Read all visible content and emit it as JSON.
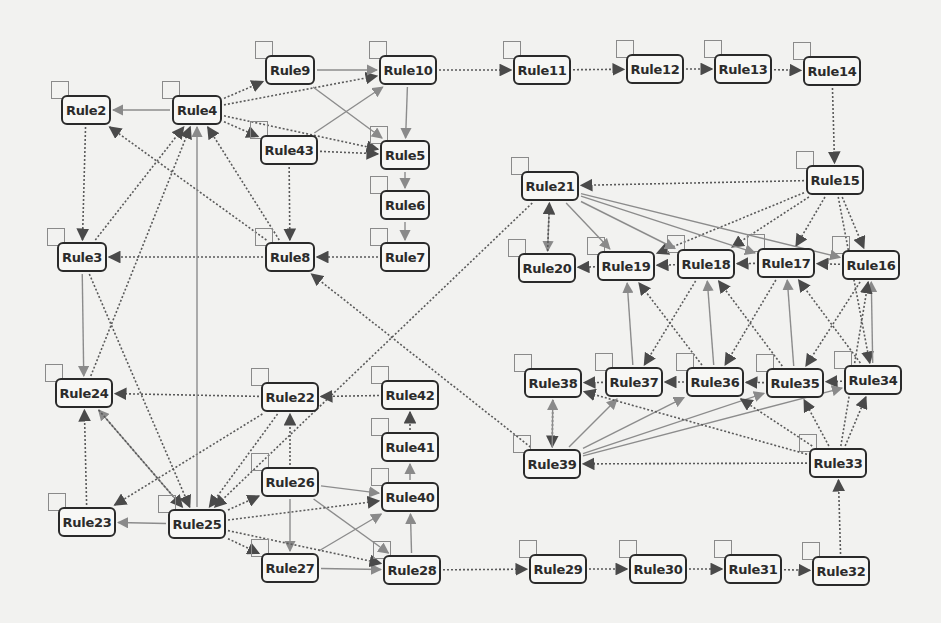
{
  "diagram": {
    "type": "directed-graph",
    "colors": {
      "background": "#f2f2f0",
      "node_border": "#2a2a2a",
      "edge_solid": "#8c8c8c",
      "edge_dashed": "#5a5a5a"
    },
    "nodes": [
      {
        "id": "Rule2",
        "label": "Rule2",
        "x": 86,
        "y": 110,
        "w": 50
      },
      {
        "id": "Rule4",
        "label": "Rule4",
        "x": 197,
        "y": 110,
        "w": 50
      },
      {
        "id": "Rule9",
        "label": "Rule9",
        "x": 290,
        "y": 70,
        "w": 50
      },
      {
        "id": "Rule10",
        "label": "Rule10",
        "x": 408,
        "y": 70,
        "w": 58
      },
      {
        "id": "Rule43",
        "label": "Rule43",
        "x": 289,
        "y": 150,
        "w": 58
      },
      {
        "id": "Rule5",
        "label": "Rule5",
        "x": 405,
        "y": 155,
        "w": 50
      },
      {
        "id": "Rule6",
        "label": "Rule6",
        "x": 405,
        "y": 205,
        "w": 50
      },
      {
        "id": "Rule7",
        "label": "Rule7",
        "x": 405,
        "y": 257,
        "w": 50
      },
      {
        "id": "Rule3",
        "label": "Rule3",
        "x": 82,
        "y": 257,
        "w": 50
      },
      {
        "id": "Rule8",
        "label": "Rule8",
        "x": 290,
        "y": 257,
        "w": 50
      },
      {
        "id": "Rule11",
        "label": "Rule11",
        "x": 542,
        "y": 70,
        "w": 58
      },
      {
        "id": "Rule12",
        "label": "Rule12",
        "x": 655,
        "y": 69,
        "w": 58
      },
      {
        "id": "Rule13",
        "label": "Rule13",
        "x": 743,
        "y": 69,
        "w": 58
      },
      {
        "id": "Rule14",
        "label": "Rule14",
        "x": 832,
        "y": 71,
        "w": 58
      },
      {
        "id": "Rule21",
        "label": "Rule21",
        "x": 550,
        "y": 186,
        "w": 58
      },
      {
        "id": "Rule15",
        "label": "Rule15",
        "x": 835,
        "y": 180,
        "w": 58
      },
      {
        "id": "Rule20",
        "label": "Rule20",
        "x": 547,
        "y": 268,
        "w": 58
      },
      {
        "id": "Rule19",
        "label": "Rule19",
        "x": 626,
        "y": 266,
        "w": 58
      },
      {
        "id": "Rule18",
        "label": "Rule18",
        "x": 706,
        "y": 264,
        "w": 58
      },
      {
        "id": "Rule17",
        "label": "Rule17",
        "x": 786,
        "y": 263,
        "w": 58
      },
      {
        "id": "Rule16",
        "label": "Rule16",
        "x": 871,
        "y": 265,
        "w": 58
      },
      {
        "id": "Rule24",
        "label": "Rule24",
        "x": 84,
        "y": 393,
        "w": 58
      },
      {
        "id": "Rule22",
        "label": "Rule22",
        "x": 290,
        "y": 397,
        "w": 58
      },
      {
        "id": "Rule42",
        "label": "Rule42",
        "x": 410,
        "y": 395,
        "w": 58
      },
      {
        "id": "Rule41",
        "label": "Rule41",
        "x": 410,
        "y": 447,
        "w": 58
      },
      {
        "id": "Rule40",
        "label": "Rule40",
        "x": 410,
        "y": 497,
        "w": 58
      },
      {
        "id": "Rule26",
        "label": "Rule26",
        "x": 290,
        "y": 482,
        "w": 58
      },
      {
        "id": "Rule23",
        "label": "Rule23",
        "x": 87,
        "y": 522,
        "w": 58
      },
      {
        "id": "Rule25",
        "label": "Rule25",
        "x": 197,
        "y": 524,
        "w": 58
      },
      {
        "id": "Rule27",
        "label": "Rule27",
        "x": 290,
        "y": 568,
        "w": 58
      },
      {
        "id": "Rule28",
        "label": "Rule28",
        "x": 412,
        "y": 570,
        "w": 58
      },
      {
        "id": "Rule38",
        "label": "Rule38",
        "x": 553,
        "y": 383,
        "w": 58
      },
      {
        "id": "Rule37",
        "label": "Rule37",
        "x": 634,
        "y": 382,
        "w": 58
      },
      {
        "id": "Rule36",
        "label": "Rule36",
        "x": 715,
        "y": 382,
        "w": 58
      },
      {
        "id": "Rule35",
        "label": "Rule35",
        "x": 795,
        "y": 383,
        "w": 58
      },
      {
        "id": "Rule34",
        "label": "Rule34",
        "x": 873,
        "y": 380,
        "w": 58
      },
      {
        "id": "Rule39",
        "label": "Rule39",
        "x": 552,
        "y": 464,
        "w": 58
      },
      {
        "id": "Rule33",
        "label": "Rule33",
        "x": 838,
        "y": 463,
        "w": 58
      },
      {
        "id": "Rule29",
        "label": "Rule29",
        "x": 558,
        "y": 569,
        "w": 58
      },
      {
        "id": "Rule30",
        "label": "Rule30",
        "x": 658,
        "y": 569,
        "w": 58
      },
      {
        "id": "Rule31",
        "label": "Rule31",
        "x": 753,
        "y": 569,
        "w": 58
      },
      {
        "id": "Rule32",
        "label": "Rule32",
        "x": 841,
        "y": 571,
        "w": 58
      }
    ],
    "edges": [
      {
        "from": "Rule4",
        "to": "Rule2",
        "style": "solid"
      },
      {
        "from": "Rule4",
        "to": "Rule9",
        "style": "dashed"
      },
      {
        "from": "Rule4",
        "to": "Rule10",
        "style": "dashed"
      },
      {
        "from": "Rule4",
        "to": "Rule43",
        "style": "dashed"
      },
      {
        "from": "Rule4",
        "to": "Rule5",
        "style": "dashed"
      },
      {
        "from": "Rule9",
        "to": "Rule10",
        "style": "solid"
      },
      {
        "from": "Rule9",
        "to": "Rule5",
        "style": "solid"
      },
      {
        "from": "Rule43",
        "to": "Rule10",
        "style": "solid"
      },
      {
        "from": "Rule43",
        "to": "Rule5",
        "style": "dashed"
      },
      {
        "from": "Rule10",
        "to": "Rule5",
        "style": "solid"
      },
      {
        "from": "Rule5",
        "to": "Rule6",
        "style": "solid"
      },
      {
        "from": "Rule6",
        "to": "Rule7",
        "style": "solid"
      },
      {
        "from": "Rule7",
        "to": "Rule8",
        "style": "dashed"
      },
      {
        "from": "Rule43",
        "to": "Rule8",
        "style": "dashed"
      },
      {
        "from": "Rule8",
        "to": "Rule3",
        "style": "dashed"
      },
      {
        "from": "Rule8",
        "to": "Rule2",
        "style": "dashed"
      },
      {
        "from": "Rule8",
        "to": "Rule4",
        "style": "dashed"
      },
      {
        "from": "Rule2",
        "to": "Rule3",
        "style": "dashed"
      },
      {
        "from": "Rule3",
        "to": "Rule4",
        "style": "dashed"
      },
      {
        "from": "Rule10",
        "to": "Rule11",
        "style": "dashed"
      },
      {
        "from": "Rule11",
        "to": "Rule12",
        "style": "dashed"
      },
      {
        "from": "Rule12",
        "to": "Rule13",
        "style": "dashed"
      },
      {
        "from": "Rule13",
        "to": "Rule14",
        "style": "dashed"
      },
      {
        "from": "Rule14",
        "to": "Rule15",
        "style": "dashed"
      },
      {
        "from": "Rule15",
        "to": "Rule21",
        "style": "dashed"
      },
      {
        "from": "Rule15",
        "to": "Rule19",
        "style": "dashed"
      },
      {
        "from": "Rule15",
        "to": "Rule18",
        "style": "dashed"
      },
      {
        "from": "Rule15",
        "to": "Rule17",
        "style": "dashed"
      },
      {
        "from": "Rule15",
        "to": "Rule16",
        "style": "dashed"
      },
      {
        "from": "Rule15",
        "to": "Rule34",
        "style": "dashed"
      },
      {
        "from": "Rule21",
        "to": "Rule20",
        "style": "solid"
      },
      {
        "from": "Rule20",
        "to": "Rule21",
        "style": "dashed"
      },
      {
        "from": "Rule21",
        "to": "Rule19",
        "style": "solid"
      },
      {
        "from": "Rule21",
        "to": "Rule18",
        "style": "solid"
      },
      {
        "from": "Rule21",
        "to": "Rule17",
        "style": "solid"
      },
      {
        "from": "Rule21",
        "to": "Rule16",
        "style": "solid"
      },
      {
        "from": "Rule16",
        "to": "Rule17",
        "style": "dashed"
      },
      {
        "from": "Rule17",
        "to": "Rule18",
        "style": "dashed"
      },
      {
        "from": "Rule18",
        "to": "Rule19",
        "style": "dashed"
      },
      {
        "from": "Rule19",
        "to": "Rule20",
        "style": "dashed"
      },
      {
        "from": "Rule21",
        "to": "Rule25",
        "style": "dashed"
      },
      {
        "from": "Rule39",
        "to": "Rule8",
        "style": "dashed"
      },
      {
        "from": "Rule37",
        "to": "Rule19",
        "style": "solid"
      },
      {
        "from": "Rule36",
        "to": "Rule19",
        "style": "dashed"
      },
      {
        "from": "Rule36",
        "to": "Rule18",
        "style": "solid"
      },
      {
        "from": "Rule35",
        "to": "Rule18",
        "style": "dashed"
      },
      {
        "from": "Rule35",
        "to": "Rule17",
        "style": "solid"
      },
      {
        "from": "Rule34",
        "to": "Rule17",
        "style": "dashed"
      },
      {
        "from": "Rule34",
        "to": "Rule16",
        "style": "solid"
      },
      {
        "from": "Rule18",
        "to": "Rule37",
        "style": "dashed"
      },
      {
        "from": "Rule17",
        "to": "Rule36",
        "style": "dashed"
      },
      {
        "from": "Rule16",
        "to": "Rule35",
        "style": "dashed"
      },
      {
        "from": "Rule34",
        "to": "Rule35",
        "style": "dashed"
      },
      {
        "from": "Rule35",
        "to": "Rule36",
        "style": "dashed"
      },
      {
        "from": "Rule36",
        "to": "Rule37",
        "style": "dashed"
      },
      {
        "from": "Rule37",
        "to": "Rule38",
        "style": "dashed"
      },
      {
        "from": "Rule38",
        "to": "Rule39",
        "style": "dashed"
      },
      {
        "from": "Rule39",
        "to": "Rule38",
        "style": "solid"
      },
      {
        "from": "Rule39",
        "to": "Rule37",
        "style": "solid"
      },
      {
        "from": "Rule39",
        "to": "Rule36",
        "style": "solid"
      },
      {
        "from": "Rule39",
        "to": "Rule35",
        "style": "solid"
      },
      {
        "from": "Rule39",
        "to": "Rule34",
        "style": "solid"
      },
      {
        "from": "Rule33",
        "to": "Rule39",
        "style": "dashed"
      },
      {
        "from": "Rule33",
        "to": "Rule38",
        "style": "dashed"
      },
      {
        "from": "Rule33",
        "to": "Rule36",
        "style": "dashed"
      },
      {
        "from": "Rule33",
        "to": "Rule35",
        "style": "dashed"
      },
      {
        "from": "Rule33",
        "to": "Rule34",
        "style": "dashed"
      },
      {
        "from": "Rule33",
        "to": "Rule16",
        "style": "dashed"
      },
      {
        "from": "Rule32",
        "to": "Rule33",
        "style": "dashed"
      },
      {
        "from": "Rule28",
        "to": "Rule29",
        "style": "dashed"
      },
      {
        "from": "Rule29",
        "to": "Rule30",
        "style": "dashed"
      },
      {
        "from": "Rule30",
        "to": "Rule31",
        "style": "dashed"
      },
      {
        "from": "Rule31",
        "to": "Rule32",
        "style": "dashed"
      },
      {
        "from": "Rule42",
        "to": "Rule22",
        "style": "dashed"
      },
      {
        "from": "Rule22",
        "to": "Rule24",
        "style": "dashed"
      },
      {
        "from": "Rule22",
        "to": "Rule23",
        "style": "dashed"
      },
      {
        "from": "Rule22",
        "to": "Rule25",
        "style": "dashed"
      },
      {
        "from": "Rule26",
        "to": "Rule22",
        "style": "dashed"
      },
      {
        "from": "Rule41",
        "to": "Rule42",
        "style": "dashed"
      },
      {
        "from": "Rule40",
        "to": "Rule41",
        "style": "solid"
      },
      {
        "from": "Rule26",
        "to": "Rule40",
        "style": "solid"
      },
      {
        "from": "Rule26",
        "to": "Rule28",
        "style": "solid"
      },
      {
        "from": "Rule26",
        "to": "Rule27",
        "style": "solid"
      },
      {
        "from": "Rule27",
        "to": "Rule40",
        "style": "solid"
      },
      {
        "from": "Rule27",
        "to": "Rule28",
        "style": "solid"
      },
      {
        "from": "Rule28",
        "to": "Rule40",
        "style": "solid"
      },
      {
        "from": "Rule25",
        "to": "Rule23",
        "style": "solid"
      },
      {
        "from": "Rule25",
        "to": "Rule26",
        "style": "dashed"
      },
      {
        "from": "Rule25",
        "to": "Rule40",
        "style": "dashed"
      },
      {
        "from": "Rule25",
        "to": "Rule27",
        "style": "dashed"
      },
      {
        "from": "Rule25",
        "to": "Rule28",
        "style": "dashed"
      },
      {
        "from": "Rule25",
        "to": "Rule24",
        "style": "solid"
      },
      {
        "from": "Rule24",
        "to": "Rule25",
        "style": "dashed"
      },
      {
        "from": "Rule3",
        "to": "Rule25",
        "style": "dashed"
      },
      {
        "from": "Rule23",
        "to": "Rule24",
        "style": "dashed"
      },
      {
        "from": "Rule24",
        "to": "Rule4",
        "style": "dashed"
      },
      {
        "from": "Rule25",
        "to": "Rule4",
        "style": "solid"
      },
      {
        "from": "Rule3",
        "to": "Rule24",
        "style": "solid"
      }
    ]
  }
}
